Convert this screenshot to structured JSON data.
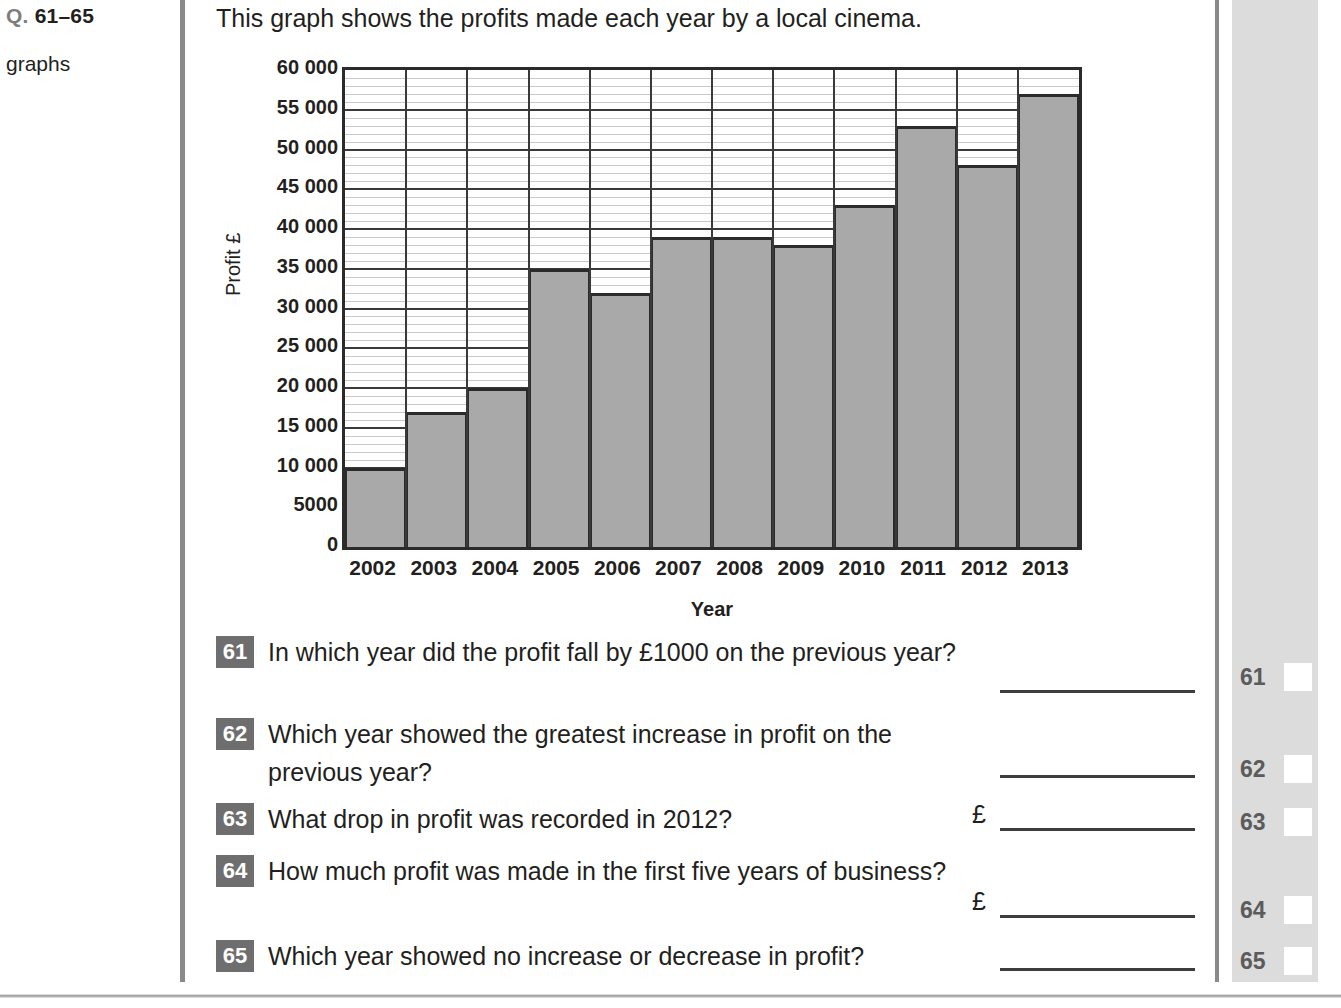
{
  "left_margin": {
    "question_prefix": "Q.",
    "question_range": "61–65",
    "topic": "graphs"
  },
  "intro": "This graph shows the profits made each year by a local cinema.",
  "chart_data": {
    "type": "bar",
    "title": "",
    "xlabel": "Year",
    "ylabel": "Profit £",
    "categories": [
      "2002",
      "2003",
      "2004",
      "2005",
      "2006",
      "2007",
      "2008",
      "2009",
      "2010",
      "2011",
      "2012",
      "2013"
    ],
    "values": [
      10000,
      17000,
      20000,
      35000,
      32000,
      39000,
      39000,
      38000,
      43000,
      53000,
      48000,
      57000
    ],
    "ylim": [
      0,
      60000
    ],
    "major_tick_step": 5000,
    "minor_tick_step": 1000,
    "grid": true,
    "legend": "none",
    "ytick_labels": [
      "60 000",
      "55 000",
      "50 000",
      "45 000",
      "40 000",
      "35 000",
      "30 000",
      "25 000",
      "20 000",
      "15 000",
      "10 000",
      "5000",
      "0"
    ],
    "ytick_values": [
      60000,
      55000,
      50000,
      45000,
      40000,
      35000,
      30000,
      25000,
      20000,
      15000,
      10000,
      5000,
      0
    ],
    "bar_fill_color": "#a9a9a9",
    "bar_border_color": "#2b2b2b",
    "gridline_major_color": "#3a3a3a",
    "gridline_minor_color": "#c9c9c9"
  },
  "questions": [
    {
      "number": "61",
      "text": "In which year did the profit fall by £1000 on the previous year?",
      "prefix": "",
      "answer_value": ""
    },
    {
      "number": "62",
      "text": "Which year showed the greatest increase in profit on the previous year?",
      "prefix": "",
      "answer_value": ""
    },
    {
      "number": "63",
      "text": "What drop in profit was recorded in 2012?",
      "prefix": "£",
      "answer_value": ""
    },
    {
      "number": "64",
      "text": "How much profit was made in the first five years of business?",
      "prefix": "£",
      "answer_value": ""
    },
    {
      "number": "65",
      "text": "Which year showed no increase or decrease in profit?",
      "prefix": "",
      "answer_value": ""
    }
  ],
  "marking_strip": {
    "numbers": [
      "61",
      "62",
      "63",
      "64",
      "65"
    ],
    "background_color": "#dcdcdc",
    "box_color": "#ffffff"
  }
}
